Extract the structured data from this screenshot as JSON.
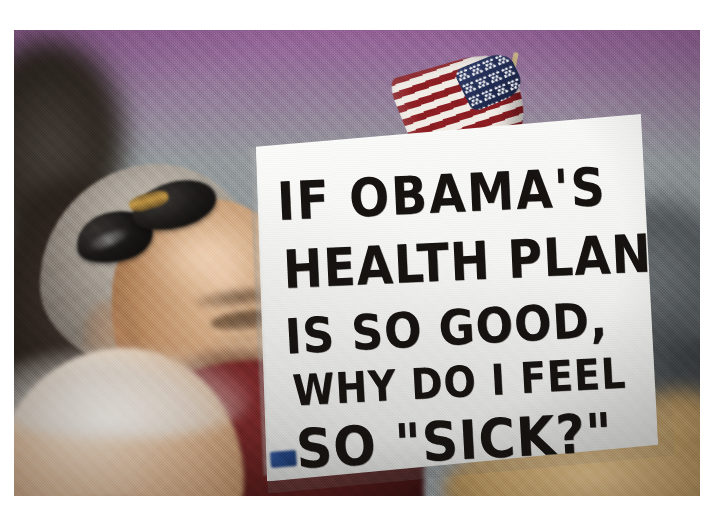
{
  "image": {
    "type": "photograph",
    "subject": "protest-rally-crowd",
    "description": "Older man with gray hair and mustache, sunglasses pushed up on his head, holding a hand-lettered white protest placard with a small American flag taped behind it",
    "orientation": "landscape",
    "border": {
      "style": "white-margin",
      "color": "#ffffff"
    },
    "background": {
      "color": "#8e9396",
      "description": "out-of-focus grey indoor hall wall"
    }
  },
  "sign": {
    "name": "protest-placard",
    "material": "white poster board",
    "ink_color": "#15120f",
    "surface_color": "#fafaf8",
    "lines": [
      "IF OBAMA'S",
      "HEALTH PLAN",
      "IS SO gOOD,",
      "WHY DO I FEEL",
      "SO \"SICK?\""
    ],
    "full_text": "IF OBAMA'S HEALTH PLAN IS SO gOOD, WHY DO I FEEL SO \"SICK?\"",
    "tape_color": "#23407a"
  },
  "flag": {
    "name": "american-flag",
    "description": "small hand-held United States flag, furled, angled diagonally behind the sign top",
    "stripe_red": "#8c1d22",
    "stripe_white": "#f2ece6",
    "canton_blue": "#212c52",
    "pole_color": "#b9a478"
  },
  "people": [
    {
      "name": "sign-holder",
      "position": "center-left",
      "hair": "gray",
      "facial_hair": "gray mustache",
      "accessory": "black sunglasses on top of head",
      "clothing": "dark maroon polo shirt with thin light stripes",
      "clothing_color": "#5e1f1f",
      "expression": "smiling"
    },
    {
      "name": "foreground-bald-man",
      "position": "bottom-left",
      "hair": "white fringe, balding",
      "focus": "blurred foreground"
    },
    {
      "name": "blonde-person",
      "position": "bottom-right",
      "hair": "blonde",
      "focus": "blurred foreground"
    },
    {
      "name": "dark-figure-left",
      "position": "far-left",
      "focus": "shadowed and blurred"
    },
    {
      "name": "dark-figure-right",
      "position": "right",
      "focus": "shadowed and blurred"
    }
  ]
}
